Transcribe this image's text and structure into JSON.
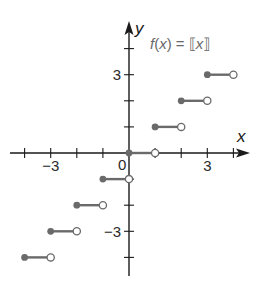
{
  "chart_data": {
    "type": "line",
    "subtype": "step-function",
    "xlabel": "x",
    "ylabel": "y",
    "xlim": [
      -4.5,
      4.5
    ],
    "ylim": [
      -4.5,
      4.5
    ],
    "grid": false,
    "x_tick_labels": [
      {
        "value": -3,
        "label": "−3"
      },
      {
        "value": 0,
        "label": "0"
      },
      {
        "value": 3,
        "label": "3"
      }
    ],
    "y_tick_labels": [
      {
        "value": 3,
        "label": "3"
      },
      {
        "value": -3,
        "label": "−3"
      }
    ],
    "x_ticks": [
      -4,
      -3,
      -2,
      -1,
      1,
      2,
      3,
      4
    ],
    "y_ticks": [
      -4,
      -3,
      -2,
      -1,
      1,
      2,
      3,
      4
    ],
    "segments": [
      {
        "x_start": -4,
        "x_end": -3,
        "y": -4,
        "start": "closed",
        "end": "open"
      },
      {
        "x_start": -3,
        "x_end": -2,
        "y": -3,
        "start": "closed",
        "end": "open"
      },
      {
        "x_start": -2,
        "x_end": -1,
        "y": -2,
        "start": "closed",
        "end": "open"
      },
      {
        "x_start": -1,
        "x_end": 0,
        "y": -1,
        "start": "closed",
        "end": "open"
      },
      {
        "x_start": 0,
        "x_end": 1,
        "y": 0,
        "start": "closed",
        "end": "open"
      },
      {
        "x_start": 1,
        "x_end": 2,
        "y": 1,
        "start": "closed",
        "end": "open"
      },
      {
        "x_start": 2,
        "x_end": 3,
        "y": 2,
        "start": "closed",
        "end": "open"
      },
      {
        "x_start": 3,
        "x_end": 4,
        "y": 3,
        "start": "closed",
        "end": "open"
      }
    ],
    "colors": {
      "axis": "#1a1a1a",
      "segment": "#6a6a6a"
    }
  },
  "labels": {
    "x_axis": "x",
    "y_axis": "y",
    "origin": "0"
  }
}
